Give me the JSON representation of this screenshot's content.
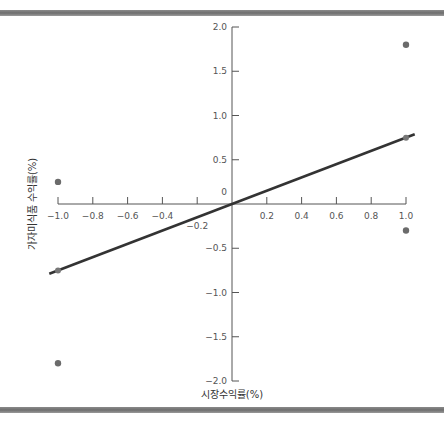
{
  "chart_data": {
    "type": "scatter",
    "title": "",
    "xlabel": "시장수익률(%)",
    "ylabel": "가자미식품 수익률(%)",
    "xlim": [
      -1.0,
      1.0
    ],
    "ylim": [
      -2.0,
      2.0
    ],
    "grid": false,
    "x_ticks": [
      "-1.0",
      "-0.8",
      "-0.6",
      "-0.4",
      "-0.2",
      "0.2",
      "0.4",
      "0.6",
      "0.8",
      "1.0"
    ],
    "y_ticks": [
      "2.0",
      "1.5",
      "1.0",
      "0.5",
      "0",
      "-0.5",
      "-1.0",
      "-1.5",
      "-2.0"
    ],
    "series": [
      {
        "name": "observations",
        "points": [
          {
            "x": 1.0,
            "y": 1.8
          },
          {
            "x": -1.0,
            "y": 0.25
          },
          {
            "x": 1.0,
            "y": -0.3
          },
          {
            "x": -1.0,
            "y": -1.8
          }
        ]
      },
      {
        "name": "regression-line",
        "type": "line",
        "points": [
          {
            "x": -1.0,
            "y": -0.75
          },
          {
            "x": 1.0,
            "y": 0.75
          }
        ]
      }
    ],
    "colors": {
      "points": "#6b6b6b",
      "line": "#333333",
      "axis": "#555555",
      "frame": "#7a7a7a"
    }
  }
}
